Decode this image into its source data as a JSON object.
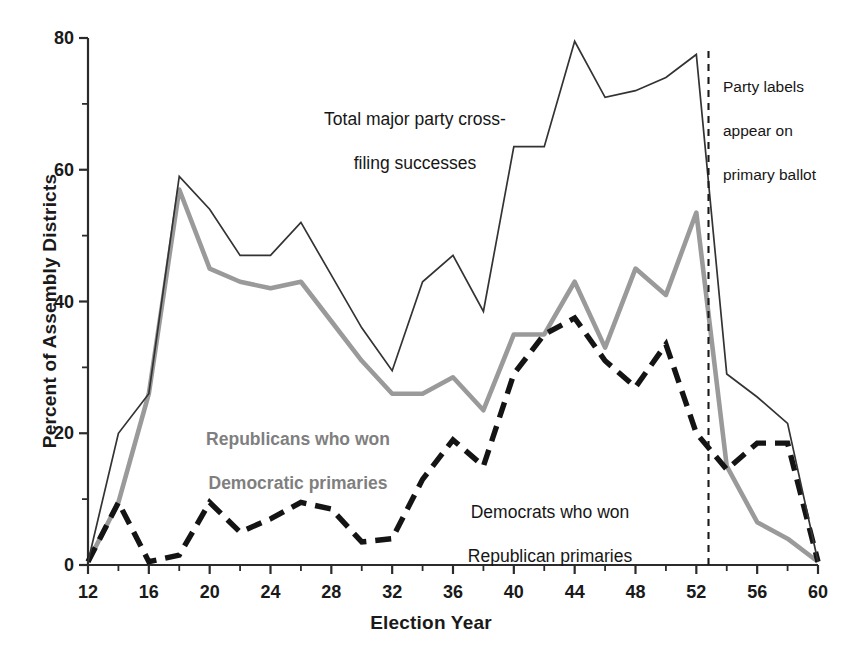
{
  "chart_data": {
    "type": "line",
    "title": "",
    "xlabel": "Election Year",
    "ylabel": "Percent of Assembly Districts",
    "xlim": [
      12,
      60
    ],
    "ylim": [
      0,
      80
    ],
    "xticks": [
      12,
      16,
      20,
      24,
      28,
      32,
      36,
      40,
      44,
      48,
      52,
      56,
      60
    ],
    "xtick_labels": [
      "12",
      "16",
      "20",
      "24",
      "28",
      "32",
      "36",
      "40",
      "44",
      "48",
      "52",
      "56",
      "60"
    ],
    "yticks": [
      0,
      20,
      40,
      60,
      80
    ],
    "ytick_labels": [
      "0",
      "20",
      "40",
      "60",
      "80"
    ],
    "yticks_minor": [
      10,
      30,
      50,
      70
    ],
    "grid": false,
    "legend_position": "inline-annotations",
    "x": [
      12,
      14,
      16,
      18,
      20,
      22,
      24,
      26,
      28,
      30,
      32,
      34,
      36,
      38,
      40,
      42,
      44,
      46,
      48,
      50,
      52,
      54,
      56,
      58,
      60
    ],
    "series": [
      {
        "name": "Total major party cross-filing successes",
        "style": "solid-thin",
        "color": "#333333",
        "values": [
          0.5,
          20.0,
          26.0,
          59.0,
          54.0,
          47.0,
          47.0,
          52.0,
          44.0,
          36.0,
          29.5,
          43.0,
          47.0,
          38.5,
          63.5,
          63.5,
          79.5,
          71.0,
          72.0,
          74.0,
          77.5,
          29.0,
          25.5,
          21.5,
          0.5
        ]
      },
      {
        "name": "Republicans who won Democratic primaries",
        "style": "solid-thick-gray",
        "color": "#9a9a9a",
        "values": [
          0.5,
          9.5,
          26.0,
          57.0,
          45.0,
          43.0,
          42.0,
          43.0,
          37.0,
          31.0,
          26.0,
          26.0,
          28.5,
          23.5,
          35.0,
          35.0,
          43.0,
          33.0,
          45.0,
          41.0,
          53.5,
          15.0,
          6.5,
          4.0,
          0.5
        ]
      },
      {
        "name": "Democrats who won Republican primaries",
        "style": "dashed-thick-black",
        "color": "#141414",
        "values": [
          0.5,
          9.5,
          0.5,
          1.5,
          9.5,
          5.0,
          7.0,
          9.5,
          8.5,
          3.5,
          4.0,
          13.0,
          19.0,
          15.0,
          29.0,
          35.0,
          37.5,
          31.0,
          27.0,
          33.5,
          20.0,
          14.5,
          18.5,
          18.5,
          0.5
        ]
      }
    ],
    "annotations": [
      {
        "name": "total-series-label",
        "text": "Total major party cross-\nfiling successes",
        "lines": [
          "Total major party cross-",
          "filing successes"
        ],
        "color": "#161616"
      },
      {
        "name": "republicans-series-label",
        "text": "Republicans who won\nDemocratic primaries",
        "lines": [
          "Republicans who won",
          "Democratic primaries"
        ],
        "color": "#7f7f7f"
      },
      {
        "name": "democrats-series-label",
        "text": "Democrats who won\nRepublican primaries",
        "lines": [
          "Democrats who won",
          "Republican primaries"
        ],
        "color": "#161616"
      },
      {
        "name": "party-labels-event-note",
        "text": "Party labels\nappear on\nprimary ballot",
        "lines": [
          "Party labels",
          "appear on",
          "primary ballot"
        ],
        "color": "#161616",
        "marker": "vertical-dashed-line",
        "marker_x": 52.8
      }
    ]
  },
  "axis": {
    "ylabel": "Percent of Assembly Districts",
    "xlabel": "Election Year",
    "ytick_labels": [
      "80",
      "60",
      "40",
      "20",
      "0"
    ],
    "xtick_labels": [
      "12",
      "16",
      "20",
      "24",
      "28",
      "32",
      "36",
      "40",
      "44",
      "48",
      "52",
      "56",
      "60"
    ]
  },
  "annotations": {
    "total": {
      "l1": "Total major party cross-",
      "l2": "filing successes"
    },
    "republicans": {
      "l1": "Republicans who won",
      "l2": "Democratic primaries"
    },
    "democrats": {
      "l1": "Democrats who won",
      "l2": "Republican primaries"
    },
    "party": {
      "l1": "Party labels",
      "l2": "appear on",
      "l3": "primary ballot"
    }
  },
  "colors": {
    "total_line": "#333333",
    "republican_line": "#9a9a9a",
    "democrat_line": "#141414",
    "text": "#161616",
    "gray_label": "#7f7f7f"
  }
}
